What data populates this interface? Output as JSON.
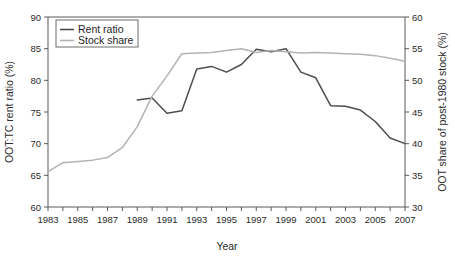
{
  "chart_data": {
    "type": "line",
    "title": "",
    "xlabel": "Year",
    "ylabel": "OOT:TC rent ratio (%)",
    "y2label": "OOT share of post-1980 stock (%)",
    "xlim": [
      1983,
      2007
    ],
    "ylim": [
      60,
      90
    ],
    "y2lim": [
      30,
      60
    ],
    "grid": false,
    "legend_position": "top-left",
    "x_tick_step": 1,
    "x_label_step": 2,
    "y_tick_step": 5,
    "y2_tick_step": 5,
    "x_ticks": [
      1983,
      1984,
      1985,
      1986,
      1987,
      1988,
      1989,
      1990,
      1991,
      1992,
      1993,
      1994,
      1995,
      1996,
      1997,
      1998,
      1999,
      2000,
      2001,
      2002,
      2003,
      2004,
      2005,
      2006,
      2007
    ],
    "x_tick_labels": [
      "1983",
      "",
      "1985",
      "",
      "1987",
      "",
      "1989",
      "",
      "1991",
      "",
      "1993",
      "",
      "1995",
      "",
      "1997",
      "",
      "1999",
      "",
      "2001",
      "",
      "2003",
      "",
      "2005",
      "",
      "2007"
    ],
    "y_ticks": [
      60,
      65,
      70,
      75,
      80,
      85,
      90
    ],
    "y_tick_labels": [
      "60",
      "65",
      "70",
      "75",
      "80",
      "85",
      "90"
    ],
    "y2_ticks": [
      30,
      35,
      40,
      45,
      50,
      55,
      60
    ],
    "y2_tick_labels": [
      "30",
      "35",
      "40",
      "45",
      "50",
      "55",
      "60"
    ],
    "series": [
      {
        "name": "Rent ratio",
        "axis": "left",
        "color": "#4d4d4d",
        "x": [
          1989,
          1990,
          1991,
          1992,
          1993,
          1994,
          1995,
          1996,
          1997,
          1998,
          1999,
          2000,
          2001,
          2002,
          2003,
          2004,
          2005,
          2006,
          2007
        ],
        "values": [
          76.9,
          77.2,
          74.8,
          75.2,
          81.8,
          82.2,
          81.3,
          82.5,
          84.9,
          84.5,
          85.0,
          81.3,
          80.4,
          76.0,
          75.9,
          75.3,
          73.5,
          70.9,
          70.0
        ]
      },
      {
        "name": "Stock share",
        "axis": "right",
        "color": "#b3b3b3",
        "x": [
          1983,
          1984,
          1985,
          1986,
          1987,
          1988,
          1989,
          1990,
          1991,
          1992,
          1993,
          1994,
          1995,
          1996,
          1997,
          1998,
          1999,
          2000,
          2001,
          2002,
          2003,
          2004,
          2005,
          2006,
          2007
        ],
        "values": [
          35.6,
          37.0,
          37.2,
          37.4,
          37.8,
          39.4,
          42.7,
          47.5,
          50.7,
          54.2,
          54.3,
          54.4,
          54.7,
          55.0,
          54.4,
          54.7,
          54.5,
          54.3,
          54.4,
          54.3,
          54.2,
          54.1,
          53.9,
          53.5,
          53.0
        ]
      }
    ]
  },
  "legend": {
    "items": [
      {
        "label": "Rent ratio",
        "color": "#4d4d4d"
      },
      {
        "label": "Stock share",
        "color": "#b3b3b3"
      }
    ]
  }
}
